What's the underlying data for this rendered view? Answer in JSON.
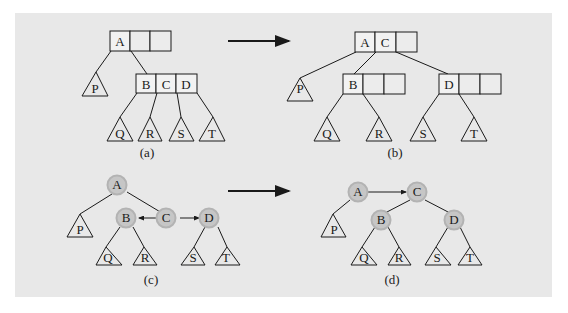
{
  "diagram": {
    "colors": {
      "panel_bg": "#e8e8e8",
      "line": "#1a1a1a",
      "node_fill": "#c9c9c9",
      "node_ring": "#b0b0b0"
    },
    "panels": [
      {
        "caption": "(a)",
        "top_node": [
          "A",
          "",
          ""
        ],
        "child_node": [
          "B",
          "C",
          "D"
        ],
        "subtrees": [
          "P",
          "Q",
          "R",
          "S",
          "T"
        ]
      },
      {
        "caption": "(b)",
        "top_node": [
          "A",
          "C",
          ""
        ],
        "children": [
          [
            "B",
            "",
            ""
          ],
          [
            "D",
            "",
            ""
          ]
        ],
        "subtrees": [
          "P",
          "Q",
          "R",
          "S",
          "T"
        ]
      },
      {
        "caption": "(c)",
        "nodes": [
          "A",
          "B",
          "C",
          "D"
        ],
        "subtrees": [
          "P",
          "Q",
          "R",
          "S",
          "T"
        ]
      },
      {
        "caption": "(d)",
        "nodes": [
          "A",
          "C",
          "B",
          "D"
        ],
        "subtrees": [
          "P",
          "Q",
          "R",
          "S",
          "T"
        ]
      }
    ],
    "labels": {
      "a_A": "A",
      "a_B": "B",
      "a_C": "C",
      "a_D": "D",
      "b_A": "A",
      "b_C": "C",
      "b_B": "B",
      "b_D": "D",
      "c_A": "A",
      "c_B": "B",
      "c_C": "C",
      "c_D": "D",
      "d_A": "A",
      "d_C": "C",
      "d_B": "B",
      "d_D": "D",
      "P": "P",
      "Q": "Q",
      "R": "R",
      "S": "S",
      "T": "T",
      "cap_a": "(a)",
      "cap_b": "(b)",
      "cap_c": "(c)",
      "cap_d": "(d)"
    }
  }
}
